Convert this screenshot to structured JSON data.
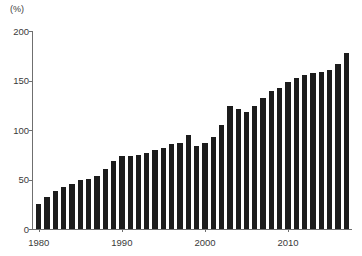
{
  "figure": {
    "unit_label": "(%)",
    "bar_color": "#1c1c1c",
    "axis_color": "#6f6f6f",
    "background_color": "#ffffff",
    "text_color": "#3a3a3a"
  },
  "chart_data": {
    "type": "bar",
    "title": "",
    "subtitle": "",
    "xlabel": "",
    "ylabel": "(%)",
    "ylim": [
      0,
      200
    ],
    "xlim": [
      1979.3,
      2017.7
    ],
    "grid": false,
    "legend": null,
    "y_ticks": [
      0,
      50,
      100,
      150,
      200
    ],
    "y_tick_labels": [
      "0",
      "50",
      "100",
      "150",
      "200"
    ],
    "x_ticks": [
      1980,
      1990,
      2000,
      2010
    ],
    "x_tick_labels": [
      "1980",
      "1990",
      "2000",
      "2010"
    ],
    "categories": [
      1980,
      1981,
      1982,
      1983,
      1984,
      1985,
      1986,
      1987,
      1988,
      1989,
      1990,
      1991,
      1992,
      1993,
      1994,
      1995,
      1996,
      1997,
      1998,
      1999,
      2000,
      2001,
      2002,
      2003,
      2004,
      2005,
      2006,
      2007,
      2008,
      2009,
      2010,
      2011,
      2012,
      2013,
      2014,
      2015,
      2016,
      2017
    ],
    "values": [
      25,
      32,
      38,
      42,
      45,
      50,
      51,
      54,
      61,
      69,
      74,
      74,
      75,
      77,
      80,
      82,
      86,
      87,
      95,
      84,
      87,
      93,
      105,
      124,
      121,
      118,
      124,
      132,
      139,
      142,
      148,
      153,
      156,
      158,
      159,
      161,
      167,
      178
    ]
  }
}
